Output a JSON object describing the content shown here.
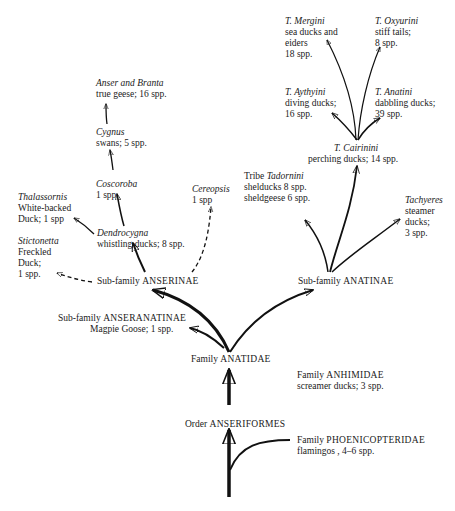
{
  "diagram": {
    "nodes": {
      "order": {
        "rank": "Order",
        "name": "ANSERIFORMES"
      },
      "phoenicopteridae": {
        "rank": "Family",
        "name": "PHOENICOPTERIDAE",
        "desc": "flamingos , 4–6 spp."
      },
      "anhimidae": {
        "rank": "Family",
        "name": "ANHIMIDAE",
        "desc": "screamer ducks; 3 spp."
      },
      "anatidae": {
        "rank": "Family",
        "name": "ANATIDAE"
      },
      "anseranatinae": {
        "rank": "Sub-family",
        "name": "ANSERANATINAE",
        "desc": "Magpie Goose; 1 spp."
      },
      "anserinae": {
        "rank": "Sub-family",
        "name": "ANSERINAE"
      },
      "anatinae": {
        "rank": "Sub-family",
        "name": "ANATINAE"
      },
      "stictonetta": {
        "genus": "Stictonetta",
        "line1": "Freckled",
        "line2": "Duck;",
        "line3": "1 spp."
      },
      "thalassornis": {
        "genus": "Thalassornis",
        "line1": "White-backed",
        "line2": "Duck; 1 spp"
      },
      "dendrocygna": {
        "genus": "Dendrocygna",
        "desc": "whistling ducks; 8 spp."
      },
      "coscoroba": {
        "genus": "Coscoroba",
        "desc": "1 spp."
      },
      "cygnus": {
        "genus": "Cygnus",
        "desc": "swans; 5 spp."
      },
      "anser_branta": {
        "genus": "Anser and Branta",
        "desc": "true geese; 16 spp."
      },
      "cereopsis": {
        "genus": "Cereopsis",
        "desc": "1 spp"
      },
      "tadornini": {
        "prefix": "Tribe",
        "genus": "Tadornini",
        "line1": "shelducks 8 spp.",
        "line2": "sheldgeese 6 spp."
      },
      "tachyeres": {
        "genus": "Tachyeres",
        "line1": "steamer",
        "line2": "ducks;",
        "line3": "3 spp."
      },
      "cairinini": {
        "genus": "T. Cairinini",
        "desc": "perching ducks; 14 spp."
      },
      "aythyini": {
        "genus": "T. Aythyini",
        "line1": "diving ducks;",
        "line2": "16 spp."
      },
      "anatini": {
        "genus": "T. Anatini",
        "line1": "dabbling ducks;",
        "line2": "39 spp."
      },
      "mergini": {
        "genus": "T. Mergini",
        "line1": "sea ducks and",
        "line2": "eiders",
        "line3": "18 spp."
      },
      "oxyurini": {
        "genus": "T. Oxyurini",
        "line1": "stiff tails;",
        "line2": "8 spp."
      }
    }
  }
}
